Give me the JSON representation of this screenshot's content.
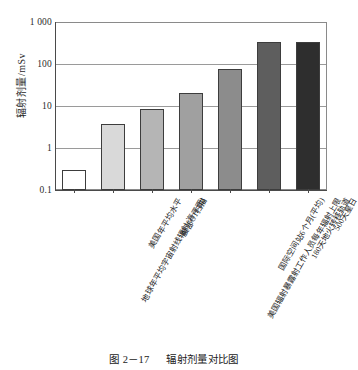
{
  "chart_data": {
    "type": "bar",
    "title": "",
    "xlabel": "",
    "ylabel": "辐射剂量/mSv",
    "scale": "log",
    "ylim": [
      0.1,
      1000
    ],
    "yticks": [
      "0.1",
      "1",
      "10",
      "100",
      "1 000"
    ],
    "grid": true,
    "legend": "none",
    "categories": [
      "地球年平均宇宙射线辐射(海平面)",
      "美国年平均水平",
      "腹部CT扫描",
      "美国辐射暴露射工作人员每年辐射上限",
      "国际空间站6个月(平均)",
      "180天地火转移轨道",
      "500天星日"
    ],
    "values": [
      0.3,
      3.8,
      8.5,
      20,
      75,
      330,
      330
    ],
    "units": "mSv",
    "bar_colors": [
      "#ffffff",
      "#d9d9d9",
      "#b5b5b5",
      "#a0a0a0",
      "#8c8c8c",
      "#5e5e5e",
      "#2e2e2e"
    ]
  },
  "caption": {
    "number": "图 2－17",
    "text": "辐射剂量对比图"
  }
}
